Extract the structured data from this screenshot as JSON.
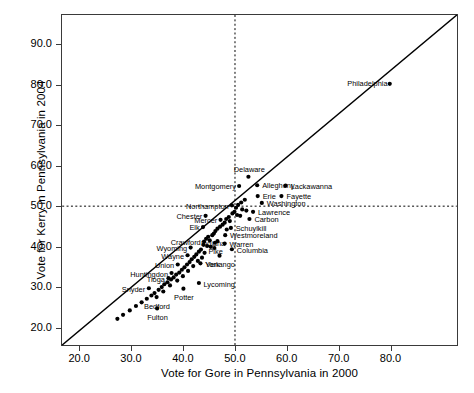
{
  "chart_data": {
    "type": "scatter",
    "title": "",
    "xlabel": "Vote for Gore in Pennsylvania in 2000",
    "ylabel": "Vote for Kerry in Pennsylvania in 2004",
    "xlim": [
      16.5,
      93.0
    ],
    "ylim": [
      15.5,
      97.5
    ],
    "xticks": [
      "20.0",
      "30.0",
      "40.0",
      "50.0",
      "60.0",
      "70.0",
      "80.0"
    ],
    "xtickvals": [
      20,
      30,
      40,
      50,
      60,
      70,
      80
    ],
    "yticks": [
      "20.0",
      "30.0",
      "40.0",
      "50.0",
      "60.0",
      "70.0",
      "80.0",
      "90.0"
    ],
    "ytickvals": [
      20,
      30,
      40,
      50,
      60,
      70,
      80,
      90
    ],
    "grid": false,
    "legend": null,
    "reference_lines": [
      {
        "name": "identity-line",
        "type": "diagonal",
        "style": "solid",
        "from": [
          16.5,
          15.5
        ],
        "to": [
          93.0,
          97.5
        ]
      },
      {
        "name": "x-fifty-line",
        "type": "vertical",
        "style": "dashed",
        "value": 50
      },
      {
        "name": "y-fifty-line",
        "type": "horizontal",
        "style": "dashed",
        "value": 50
      }
    ],
    "points": [
      {
        "label": "Philadelphia",
        "x": 80.0,
        "y": 80.4,
        "pos": "l"
      },
      {
        "label": "Delaware",
        "x": 52.6,
        "y": 57.3,
        "pos": "c_above"
      },
      {
        "label": "Montgomery",
        "x": 50.8,
        "y": 55.0,
        "pos": "l"
      },
      {
        "label": "Allegheny",
        "x": 54.3,
        "y": 55.2,
        "pos": "r"
      },
      {
        "label": "Lackawanna",
        "x": 59.8,
        "y": 55.1,
        "pos": "r"
      },
      {
        "label": "Erie",
        "x": 54.4,
        "y": 52.5,
        "pos": "r"
      },
      {
        "label": "Fayette",
        "x": 59.0,
        "y": 52.5,
        "pos": "r"
      },
      {
        "label": "Washington",
        "x": 55.2,
        "y": 50.8,
        "pos": "r"
      },
      {
        "label": "Northampton",
        "x": 49.4,
        "y": 50.2,
        "pos": "l"
      },
      {
        "label": "Lawrence",
        "x": 53.5,
        "y": 48.6,
        "pos": "r"
      },
      {
        "label": "Carbon",
        "x": 52.8,
        "y": 46.8,
        "pos": "r"
      },
      {
        "label": "Chester",
        "x": 44.3,
        "y": 47.6,
        "pos": "l"
      },
      {
        "label": "Mercer",
        "x": 47.2,
        "y": 46.6,
        "pos": "l"
      },
      {
        "label": "Schuylkill",
        "x": 49.2,
        "y": 44.6,
        "pos": "r"
      },
      {
        "label": "Elk",
        "x": 43.8,
        "y": 44.8,
        "pos": "l"
      },
      {
        "label": "Indiana",
        "x": 45.6,
        "y": 42.8,
        "pos": "c"
      },
      {
        "label": "Westmoreland",
        "x": 48.1,
        "y": 42.8,
        "pos": "r"
      },
      {
        "label": "Crawford",
        "x": 44.0,
        "y": 41.2,
        "pos": "l"
      },
      {
        "label": "Pike",
        "x": 46.1,
        "y": 40.9,
        "pos": "c"
      },
      {
        "label": "Warren",
        "x": 48.0,
        "y": 40.7,
        "pos": "r"
      },
      {
        "label": "Wyoming",
        "x": 41.4,
        "y": 39.7,
        "pos": "l"
      },
      {
        "label": "Columbia",
        "x": 49.4,
        "y": 39.3,
        "pos": "r"
      },
      {
        "label": "Venango",
        "x": 47.0,
        "y": 37.7,
        "pos": "c"
      },
      {
        "label": "Wayne",
        "x": 40.8,
        "y": 37.8,
        "pos": "l"
      },
      {
        "label": "York",
        "x": 43.3,
        "y": 35.8,
        "pos": "r"
      },
      {
        "label": "Union",
        "x": 38.9,
        "y": 35.5,
        "pos": "l"
      },
      {
        "label": "Huntingdon",
        "x": 37.7,
        "y": 33.4,
        "pos": "l"
      },
      {
        "label": "Tioga",
        "x": 37.1,
        "y": 32.1,
        "pos": "l"
      },
      {
        "label": "Lycoming",
        "x": 43.0,
        "y": 30.9,
        "pos": "r"
      },
      {
        "label": "Snyder",
        "x": 33.3,
        "y": 29.6,
        "pos": "l"
      },
      {
        "label": "Potter",
        "x": 40.0,
        "y": 29.5,
        "pos": "c"
      },
      {
        "label": "Bedford",
        "x": 34.8,
        "y": 27.4,
        "pos": "c"
      },
      {
        "label": "Fulton",
        "x": 34.9,
        "y": 24.6,
        "pos": "c"
      }
    ],
    "extra_points": [
      {
        "x": 51.9,
        "y": 51.6
      },
      {
        "x": 51.2,
        "y": 50.9
      },
      {
        "x": 50.6,
        "y": 50.3
      },
      {
        "x": 50.2,
        "y": 49.6
      },
      {
        "x": 51.4,
        "y": 49.2
      },
      {
        "x": 52.2,
        "y": 48.9
      },
      {
        "x": 49.9,
        "y": 48.6
      },
      {
        "x": 49.5,
        "y": 48.2
      },
      {
        "x": 50.4,
        "y": 47.8
      },
      {
        "x": 51.0,
        "y": 47.6
      },
      {
        "x": 48.8,
        "y": 47.3
      },
      {
        "x": 48.3,
        "y": 46.8
      },
      {
        "x": 49.0,
        "y": 46.3
      },
      {
        "x": 48.0,
        "y": 45.9
      },
      {
        "x": 47.6,
        "y": 45.4
      },
      {
        "x": 47.1,
        "y": 44.9
      },
      {
        "x": 46.6,
        "y": 44.4
      },
      {
        "x": 48.4,
        "y": 44.2
      },
      {
        "x": 46.2,
        "y": 43.8
      },
      {
        "x": 45.9,
        "y": 43.2
      },
      {
        "x": 44.8,
        "y": 42.4
      },
      {
        "x": 44.4,
        "y": 41.9
      },
      {
        "x": 45.1,
        "y": 41.5
      },
      {
        "x": 46.6,
        "y": 41.3
      },
      {
        "x": 43.9,
        "y": 40.4
      },
      {
        "x": 44.6,
        "y": 40.1
      },
      {
        "x": 45.3,
        "y": 39.9
      },
      {
        "x": 46.0,
        "y": 39.6
      },
      {
        "x": 43.4,
        "y": 39.2
      },
      {
        "x": 43.0,
        "y": 38.7
      },
      {
        "x": 44.1,
        "y": 38.4
      },
      {
        "x": 42.5,
        "y": 38.0
      },
      {
        "x": 42.1,
        "y": 37.4
      },
      {
        "x": 43.6,
        "y": 37.2
      },
      {
        "x": 41.6,
        "y": 36.8
      },
      {
        "x": 42.8,
        "y": 36.4
      },
      {
        "x": 41.2,
        "y": 36.1
      },
      {
        "x": 40.7,
        "y": 35.5
      },
      {
        "x": 41.9,
        "y": 35.1
      },
      {
        "x": 40.2,
        "y": 34.8
      },
      {
        "x": 39.7,
        "y": 34.2
      },
      {
        "x": 40.9,
        "y": 33.9
      },
      {
        "x": 39.2,
        "y": 33.5
      },
      {
        "x": 38.6,
        "y": 33.0
      },
      {
        "x": 39.9,
        "y": 32.6
      },
      {
        "x": 38.1,
        "y": 32.3
      },
      {
        "x": 37.6,
        "y": 31.8
      },
      {
        "x": 38.8,
        "y": 31.5
      },
      {
        "x": 36.9,
        "y": 31.1
      },
      {
        "x": 36.3,
        "y": 30.6
      },
      {
        "x": 37.4,
        "y": 30.3
      },
      {
        "x": 35.8,
        "y": 29.9
      },
      {
        "x": 35.2,
        "y": 29.2
      },
      {
        "x": 36.1,
        "y": 28.8
      },
      {
        "x": 34.4,
        "y": 28.4
      },
      {
        "x": 33.8,
        "y": 27.8
      },
      {
        "x": 32.9,
        "y": 27.0
      },
      {
        "x": 31.9,
        "y": 26.1
      },
      {
        "x": 30.8,
        "y": 25.2
      },
      {
        "x": 29.6,
        "y": 24.1
      },
      {
        "x": 28.3,
        "y": 23.0
      },
      {
        "x": 27.2,
        "y": 22.0
      }
    ]
  }
}
